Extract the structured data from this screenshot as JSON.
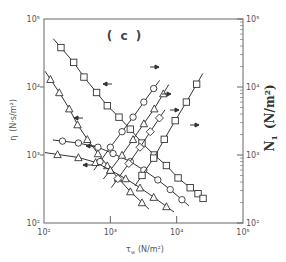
{
  "chart_data": {
    "type": "line",
    "panel_label": "( c )",
    "xlabel": "τw (N/m²)",
    "xlabel_main": "τ",
    "xlabel_sub": "w",
    "xlabel_units": "(N/m²)",
    "ylabel_left": "η (N·s/m²)",
    "ylabel_left_main": "η",
    "ylabel_left_units": "(N·s/m²)",
    "ylabel_right": "N1 (N/m²)",
    "ylabel_right_main": "N",
    "ylabel_right_sub": "1",
    "ylabel_right_units": "(N/m²)",
    "xscale": "log",
    "yscale": "log",
    "xlim": [
      100,
      100000
    ],
    "ylim_left": [
      100,
      100000
    ],
    "ylim_right": [
      100,
      100000
    ],
    "x_ticks": [
      "10²",
      "10³",
      "10⁴",
      "10⁵"
    ],
    "y_left_ticks": [
      "10²",
      "10³",
      "10⁴",
      "10⁵"
    ],
    "y_right_ticks": [
      "10²",
      "10³",
      "10⁴",
      "10⁵"
    ],
    "grid": false,
    "legend": "none (arrows indicate axis: ← left η, → right N1)",
    "series": [
      {
        "name": "η square (high)",
        "axis": "left",
        "marker": "square",
        "x": [
          180,
          280,
          400,
          620,
          900,
          1350,
          2000,
          3000,
          4600,
          7000,
          10500,
          16000,
          21000,
          25000
        ],
        "y": [
          38000,
          23000,
          14000,
          8300,
          5300,
          3600,
          2400,
          1500,
          1000,
          700,
          460,
          330,
          270,
          230
        ]
      },
      {
        "name": "η triangle (high)",
        "axis": "left",
        "marker": "triangle",
        "x": [
          125,
          170,
          240,
          320,
          450,
          650,
          900,
          1300,
          2000,
          3000
        ],
        "y": [
          13000,
          8300,
          4800,
          2800,
          1700,
          1050,
          700,
          460,
          290,
          200
        ]
      },
      {
        "name": "η circle",
        "axis": "left",
        "marker": "circle",
        "x": [
          190,
          330,
          650,
          1100,
          2000,
          3200,
          5200,
          8000,
          12000
        ],
        "y": [
          1600,
          1500,
          1300,
          1050,
          800,
          600,
          430,
          310,
          220
        ]
      },
      {
        "name": "η triangle (low)",
        "axis": "left",
        "marker": "triangle",
        "x": [
          160,
          330,
          600,
          1000,
          1700,
          2800,
          4500,
          7000
        ],
        "y": [
          1020,
          920,
          780,
          600,
          450,
          330,
          240,
          175
        ]
      },
      {
        "name": "N1 circle",
        "axis": "right",
        "marker": "circle",
        "x": [
          700,
          1000,
          1500,
          2200,
          3200,
          4500
        ],
        "y": [
          800,
          1300,
          2200,
          3600,
          6000,
          9500
        ]
      },
      {
        "name": "N1 triangle",
        "axis": "right",
        "marker": "triangle",
        "x": [
          1000,
          1500,
          2200,
          3200,
          4600,
          6300
        ],
        "y": [
          600,
          1000,
          1700,
          2900,
          4800,
          8000
        ]
      },
      {
        "name": "N1 diamond",
        "axis": "right",
        "marker": "diamond",
        "x": [
          1300,
          1900,
          2800,
          4000,
          5500
        ],
        "y": [
          450,
          750,
          1300,
          2200,
          3500
        ]
      },
      {
        "name": "N1 square",
        "axis": "right",
        "marker": "square",
        "x": [
          3000,
          4500,
          6500,
          9500,
          14000,
          20000
        ],
        "y": [
          500,
          900,
          1700,
          3200,
          6000,
          11000
        ]
      }
    ]
  },
  "colors": {
    "background": "#ffffff",
    "ink": "#333333",
    "axis": "#555555"
  }
}
